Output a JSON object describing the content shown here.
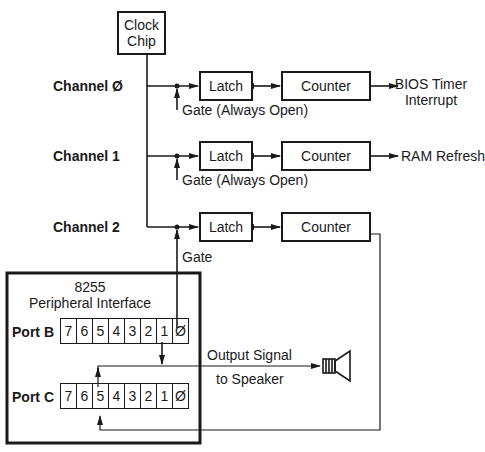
{
  "clock_chip": {
    "line1": "Clock",
    "line2": "Chip"
  },
  "channels": [
    {
      "label": "Channel Ø",
      "gate": "Gate (Always Open)",
      "latch": "Latch",
      "counter": "Counter",
      "output_line1": "BIOS Timer",
      "output_line2": "Interrupt"
    },
    {
      "label": "Channel 1",
      "gate": "Gate (Always Open)",
      "latch": "Latch",
      "counter": "Counter",
      "output_line1": "RAM Refresh"
    },
    {
      "label": "Channel 2",
      "gate": "Gate",
      "latch": "Latch",
      "counter": "Counter"
    }
  ],
  "ppi": {
    "title_line1": "8255",
    "title_line2": "Peripheral Interface",
    "port_b": {
      "label": "Port B",
      "bits": [
        "7",
        "6",
        "5",
        "4",
        "3",
        "2",
        "1",
        "Ø"
      ]
    },
    "port_c": {
      "label": "Port C",
      "bits": [
        "7",
        "6",
        "5",
        "4",
        "3",
        "2",
        "1",
        "Ø"
      ]
    }
  },
  "speaker": {
    "label_line1": "Output Signal",
    "label_line2": "to Speaker",
    "icon": "speaker-icon"
  },
  "colors": {
    "ink": "#1a1a1a",
    "background": "#ffffff"
  }
}
